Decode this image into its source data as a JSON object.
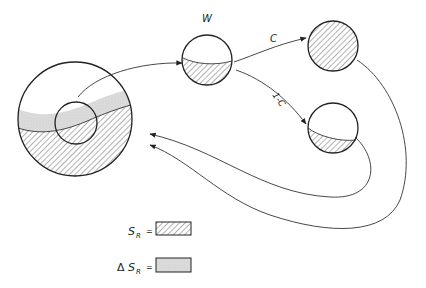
{
  "diagram": {
    "nodes": {
      "source": {
        "kind": "large-sphere-with-inner-sphere"
      },
      "w": {
        "label": "W"
      },
      "c_out": {
        "kind": "fully-hatched-sphere"
      },
      "one_minus_c_out": {
        "kind": "partially-hatched-sphere"
      }
    },
    "edges": {
      "c": {
        "label": "C"
      },
      "one_minus_c": {
        "label": "1-C"
      }
    },
    "legend": {
      "sr": {
        "symbol": "S",
        "subscript": "R",
        "equals": "=",
        "pattern": "hatched"
      },
      "delta_sr": {
        "prefix": "Δ",
        "symbol": "S",
        "subscript": "R",
        "equals": "=",
        "pattern": "stippled"
      }
    },
    "colors": {
      "line": "#222222",
      "hatch": "#555555",
      "stipple": "#d6d6d6"
    }
  }
}
